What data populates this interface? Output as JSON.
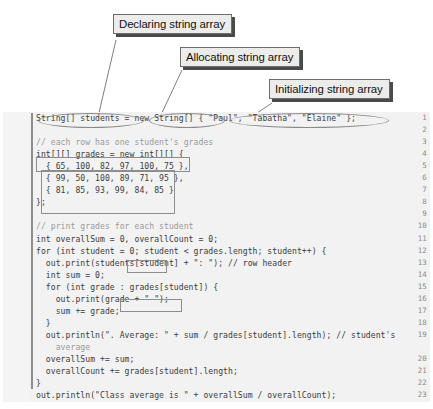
{
  "figure": {
    "kind": "annotated-java-code-listing",
    "language": "Java",
    "background_color": "#ffffff",
    "code_background_color": "#f1f1f1",
    "callout_fill": "#ececeb",
    "callout_border": "#6d6d6d",
    "callout_shadow": "#4a4a4a",
    "line_number_color": "#8a8a8a",
    "code_text_color": "#3c3c3c",
    "comment_text_color": "#9a9a9a"
  },
  "callouts": [
    {
      "id": "declaring-string-array",
      "label": "Declaring string array"
    },
    {
      "id": "allocating-string-array",
      "label": "Allocating string array"
    },
    {
      "id": "initializing-string-array",
      "label": "Initializing string array"
    },
    {
      "id": "declaring-creating-2d-array",
      "label": "Declaring and creating 2-D array"
    },
    {
      "id": "initializing-2d-array",
      "label": "Initializing 2-D array"
    },
    {
      "id": "getting-array-length",
      "label": "Getting array length"
    },
    {
      "id": "accessing-array",
      "label": "Accessing array"
    }
  ],
  "code": {
    "first_line_number": 1,
    "last_line_number": 23,
    "lines": [
      {
        "n": "1",
        "text": "String[] students = new String[] { \"Paul\", \"Tabatha\", \"Elaine\" };",
        "comment": false
      },
      {
        "n": "2",
        "text": "",
        "comment": false
      },
      {
        "n": "3",
        "text": "// each row has one student's grades",
        "comment": true
      },
      {
        "n": "4",
        "text": "int[][] grades = new int[][] {",
        "comment": false
      },
      {
        "n": "5",
        "text": "  { 65, 100, 82, 97, 100, 75 },",
        "comment": false
      },
      {
        "n": "6",
        "text": "  { 99, 50, 100, 89, 71, 95 },",
        "comment": false
      },
      {
        "n": "7",
        "text": "  { 81, 85, 93, 99, 84, 85 }",
        "comment": false
      },
      {
        "n": "8",
        "text": "};",
        "comment": false
      },
      {
        "n": "9",
        "text": "",
        "comment": false
      },
      {
        "n": "10",
        "text": "// print grades for each student",
        "comment": true
      },
      {
        "n": "11",
        "text": "int overallSum = 0, overallCount = 0;",
        "comment": false
      },
      {
        "n": "12",
        "text": "for (int student = 0; student < grades.length; student++) {",
        "comment": false
      },
      {
        "n": "13",
        "text": "  out.print(students[student] + \": \"); // row header",
        "comment": false
      },
      {
        "n": "14",
        "text": "  int sum = 0;",
        "comment": false
      },
      {
        "n": "15",
        "text": "  for (int grade : grades[student]) {",
        "comment": false
      },
      {
        "n": "16",
        "text": "    out.print(grade + \" \");",
        "comment": false
      },
      {
        "n": "17",
        "text": "    sum += grade;",
        "comment": false
      },
      {
        "n": "18",
        "text": "  }",
        "comment": false
      },
      {
        "n": "19",
        "text": "  out.println(\". Average: \" + sum / grades[student].length); // student's",
        "comment": false
      },
      {
        "n": "",
        "text": "    average",
        "comment": true
      },
      {
        "n": "20",
        "text": "  overallSum += sum;",
        "comment": false
      },
      {
        "n": "21",
        "text": "  overallCount += grades[student].length;",
        "comment": false
      },
      {
        "n": "22",
        "text": "}",
        "comment": false
      },
      {
        "n": "23",
        "text": "out.println(\"Class average is \" + overallSum / overallCount);",
        "comment": false
      }
    ]
  }
}
